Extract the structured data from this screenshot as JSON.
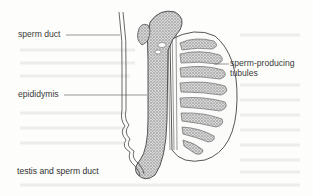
{
  "figure": {
    "caption": "testis and sperm duct",
    "labels": {
      "sperm_duct": "sperm duct",
      "epididymis": "epididymis",
      "tubules_line1": "sperm-producing",
      "tubules_line2": "tubules"
    }
  }
}
